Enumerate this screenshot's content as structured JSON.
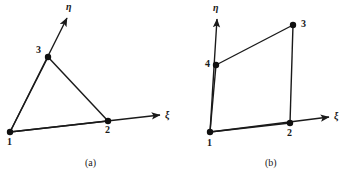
{
  "figure": {
    "background_color": "#ffffff",
    "line_color": "#1a1a1a",
    "node_color": "#101010",
    "panels": [
      {
        "id": "panel-a",
        "caption": "(a)",
        "caption_pos": [
          85,
          158
        ],
        "element_type": "triangle",
        "axes": [
          {
            "name": "xi",
            "label": "ξ",
            "label_pos": [
              165,
              110
            ],
            "from": [
              10,
              132
            ],
            "to": [
              160,
              115
            ],
            "arrow": true
          },
          {
            "name": "eta",
            "label": "η",
            "label_pos": [
              66,
              2
            ],
            "from": [
              10,
              132
            ],
            "to": [
              67,
              18
            ],
            "arrow": true
          }
        ],
        "nodes": [
          {
            "label": "1",
            "x": 10,
            "y": 132,
            "label_x": 7,
            "label_y": 137
          },
          {
            "label": "2",
            "x": 108,
            "y": 121,
            "label_x": 105,
            "label_y": 125
          },
          {
            "label": "3",
            "x": 48,
            "y": 57,
            "label_x": 36,
            "label_y": 45
          }
        ],
        "edges": [
          {
            "from": 0,
            "to": 1
          },
          {
            "from": 1,
            "to": 2
          },
          {
            "from": 2,
            "to": 0
          }
        ]
      },
      {
        "id": "panel-b",
        "caption": "(b)",
        "caption_pos": [
          265,
          158
        ],
        "element_type": "quadrilateral",
        "axes": [
          {
            "name": "xi",
            "label": "ξ",
            "label_pos": [
              334,
              111
            ],
            "from": [
              210,
              132
            ],
            "to": [
              329,
              117
            ],
            "arrow": true
          },
          {
            "name": "eta",
            "label": "η",
            "label_pos": [
              213,
              3
            ],
            "from": [
              210,
              132
            ],
            "to": [
              217,
              19
            ],
            "arrow": true
          }
        ],
        "nodes": [
          {
            "label": "1",
            "x": 210,
            "y": 132,
            "label_x": 207,
            "label_y": 138
          },
          {
            "label": "2",
            "x": 290,
            "y": 123,
            "label_x": 287,
            "label_y": 128
          },
          {
            "label": "3",
            "x": 293,
            "y": 25,
            "label_x": 301,
            "label_y": 19
          },
          {
            "label": "4",
            "x": 216,
            "y": 65,
            "label_x": 205,
            "label_y": 59
          }
        ],
        "edges": [
          {
            "from": 0,
            "to": 1
          },
          {
            "from": 1,
            "to": 2
          },
          {
            "from": 2,
            "to": 3
          },
          {
            "from": 3,
            "to": 0
          }
        ]
      }
    ]
  }
}
